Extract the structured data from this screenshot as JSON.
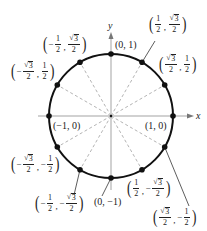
{
  "diagram": {
    "axes": {
      "x_label": "x",
      "y_label": "y"
    },
    "colors": {
      "circle": "#111111",
      "axis": "#999999",
      "radii": "#aaaaaa",
      "text": "#222222"
    },
    "points": [
      {
        "angle_deg": 0,
        "label": "(1, 0)"
      },
      {
        "angle_deg": 30,
        "label": "(√3/2, 1/2)"
      },
      {
        "angle_deg": 60,
        "label": "(1/2, √3/2)"
      },
      {
        "angle_deg": 90,
        "label": "(0, 1)"
      },
      {
        "angle_deg": 120,
        "label": "(−1/2, √3/2)"
      },
      {
        "angle_deg": 150,
        "label": "(−√3/2, 1/2)"
      },
      {
        "angle_deg": 180,
        "label": "(−1, 0)"
      },
      {
        "angle_deg": 210,
        "label": "(−√3/2, −1/2)"
      },
      {
        "angle_deg": 240,
        "label": "(−1/2, −√3/2)"
      },
      {
        "angle_deg": 270,
        "label": "(0, −1)"
      },
      {
        "angle_deg": 300,
        "label": "(1/2, −√3/2)"
      },
      {
        "angle_deg": 330,
        "label": "(√3/2, −1/2)"
      }
    ],
    "plain_labels": {
      "p0": "(1, 0)",
      "p90": "(0, 1)",
      "p180": "(−1, 0)",
      "p270": "(0, −1)"
    },
    "frac_parts": {
      "one": "1",
      "two": "2",
      "three": "3",
      "sqrt": "√",
      "minus": "−",
      "comma": ","
    }
  }
}
